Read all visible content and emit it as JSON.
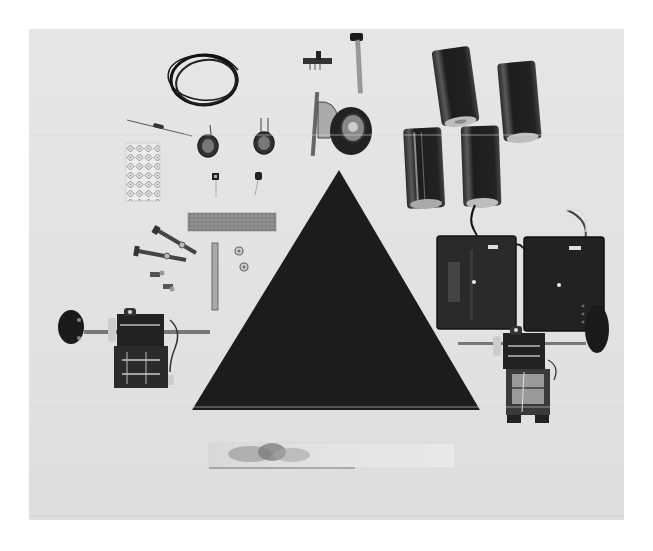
{
  "image": {
    "description": "Black-and-white photograph of robot kit components laid out on a light surface",
    "background_color": "#e3e3e3",
    "components": [
      {
        "name": "coiled-wire",
        "label": "Coil of hookup wire"
      },
      {
        "name": "resistor",
        "label": "Resistor"
      },
      {
        "name": "photocell-left",
        "label": "Photocell"
      },
      {
        "name": "photocell-right",
        "label": "Photocell"
      },
      {
        "name": "transistor-left",
        "label": "Transistor"
      },
      {
        "name": "transistor-right",
        "label": "Transistor"
      },
      {
        "name": "adhesive-pad-sheet",
        "label": "Adhesive pad sheet"
      },
      {
        "name": "slide-switch",
        "label": "Slide switch"
      },
      {
        "name": "knob-shaft",
        "label": "Knob on shaft"
      },
      {
        "name": "caster-wheel",
        "label": "Swivel caster wheel"
      },
      {
        "name": "d-cell-batteries",
        "label": "D-cell batteries",
        "count": 4
      },
      {
        "name": "battery-holders",
        "label": "Battery holders with leads",
        "count": 2
      },
      {
        "name": "circuit-strip",
        "label": "Perforated circuit strip"
      },
      {
        "name": "bolts",
        "label": "Bolts with nuts",
        "count": 2
      },
      {
        "name": "small-screws",
        "label": "Small screws",
        "count": 2
      },
      {
        "name": "metal-rod",
        "label": "Metal rod"
      },
      {
        "name": "hex-nuts",
        "label": "Hex nuts",
        "count": 2
      },
      {
        "name": "triangle-chassis",
        "label": "Black triangular chassis plate",
        "color": "#1a1a1a"
      },
      {
        "name": "gear-motor-left",
        "label": "Gear motor with wheel"
      },
      {
        "name": "gear-motor-right",
        "label": "Gear motor with wheel"
      },
      {
        "name": "metal-strip",
        "label": "Flat metal strip"
      }
    ]
  }
}
